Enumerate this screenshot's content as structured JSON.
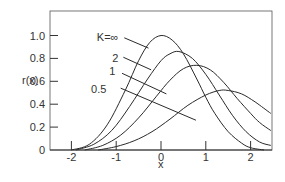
{
  "chart_data": {
    "type": "line",
    "title": "",
    "xlabel": "x",
    "ylabel": "r(x)",
    "xlim": [
      -2.45,
      2.45
    ],
    "ylim": [
      0,
      1.17
    ],
    "grid": false,
    "x_ticks": [
      {
        "value": -2,
        "label": "-2"
      },
      {
        "value": -1,
        "label": "-1"
      },
      {
        "value": 0,
        "label": "0"
      },
      {
        "value": 1,
        "label": "1"
      },
      {
        "value": 2,
        "label": "2"
      }
    ],
    "y_ticks": [
      {
        "value": 0,
        "label": "0"
      },
      {
        "value": 0.2,
        "label": "0.2"
      },
      {
        "value": 0.4,
        "label": "0.4"
      },
      {
        "value": 0.6,
        "label": "0.6"
      },
      {
        "value": 0.8,
        "label": "0.8"
      },
      {
        "value": 1.0,
        "label": "1.0"
      }
    ],
    "series": [
      {
        "name": "K = ∞",
        "label": "K=∞",
        "label_pos": [
          -0.95,
          0.985
        ],
        "leader": [
          [
            -0.82,
            0.98
          ],
          [
            -0.28,
            0.89
          ]
        ],
        "x": [
          -2.0,
          -1.6,
          -1.2,
          -0.8,
          -0.5,
          -0.25,
          0.0,
          0.25,
          0.5,
          0.8,
          1.0,
          1.2,
          1.5,
          1.8,
          2.0,
          2.3
        ],
        "y": [
          0.0,
          0.05,
          0.22,
          0.52,
          0.78,
          0.94,
          1.0,
          0.96,
          0.84,
          0.62,
          0.46,
          0.32,
          0.16,
          0.06,
          0.02,
          0.0
        ]
      },
      {
        "name": "K = 2",
        "label": "2",
        "label_pos": [
          -0.95,
          0.8
        ],
        "leader": [
          [
            -0.84,
            0.81
          ],
          [
            -0.22,
            0.7
          ]
        ],
        "x": [
          -1.9,
          -1.5,
          -1.1,
          -0.7,
          -0.3,
          0.0,
          0.2,
          0.4,
          0.7,
          1.0,
          1.3,
          1.6,
          1.9,
          2.2,
          2.45
        ],
        "y": [
          0.0,
          0.05,
          0.17,
          0.38,
          0.62,
          0.78,
          0.84,
          0.86,
          0.8,
          0.66,
          0.48,
          0.3,
          0.16,
          0.07,
          0.04
        ]
      },
      {
        "name": "K = 1",
        "label": "1",
        "label_pos": [
          -1.02,
          0.69
        ],
        "leader": [
          [
            -0.87,
            0.67
          ],
          [
            0.12,
            0.49
          ]
        ],
        "x": [
          -1.7,
          -1.3,
          -0.9,
          -0.5,
          -0.1,
          0.2,
          0.5,
          0.8,
          1.1,
          1.4,
          1.7,
          2.0,
          2.2,
          2.45
        ],
        "y": [
          0.0,
          0.04,
          0.13,
          0.28,
          0.47,
          0.61,
          0.71,
          0.74,
          0.7,
          0.59,
          0.45,
          0.32,
          0.24,
          0.17
        ]
      },
      {
        "name": "K = 0.5",
        "label": "0.5",
        "label_pos": [
          -1.22,
          0.53
        ],
        "leader": [
          [
            -0.9,
            0.54
          ],
          [
            0.78,
            0.26
          ]
        ],
        "x": [
          -1.4,
          -1.0,
          -0.6,
          -0.2,
          0.2,
          0.6,
          1.0,
          1.3,
          1.5,
          1.8,
          2.1,
          2.45
        ],
        "y": [
          0.0,
          0.03,
          0.08,
          0.16,
          0.27,
          0.39,
          0.48,
          0.52,
          0.52,
          0.49,
          0.42,
          0.32
        ]
      }
    ]
  }
}
